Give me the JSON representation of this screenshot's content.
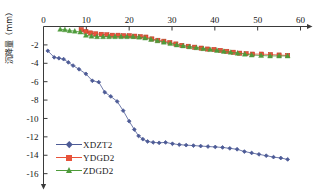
{
  "chart_data": {
    "type": "line",
    "title": "",
    "xlabel": "",
    "ylabel": "沉降量（mm）",
    "xlim": [
      0,
      60
    ],
    "ylim": [
      -16,
      0
    ],
    "xticks": [
      0,
      10,
      20,
      30,
      40,
      50,
      60
    ],
    "yticks": [
      -2,
      -4,
      -6,
      -8,
      -10,
      -12,
      -14,
      -16
    ],
    "xticklabels": [
      "0",
      "10",
      "20",
      "30",
      "40",
      "50",
      "60"
    ],
    "yticklabels": [
      "-2",
      "-4",
      "-6",
      "-8",
      "-10",
      "-12",
      "-14",
      "-16"
    ],
    "grid": false,
    "legend_position": "lower-left-inside",
    "axis_style": "top-x-axis-with-arrow, left-y-axis-with-arrow",
    "series": [
      {
        "name": "XDZT2",
        "color": "#4d5b96",
        "marker": "diamond",
        "x": [
          1.0,
          2.5,
          3.6,
          4.7,
          5.8,
          6.9,
          8.3,
          9.9,
          11.4,
          12.9,
          14.3,
          15.7,
          17.2,
          18.6,
          20.0,
          21.2,
          22.2,
          23.2,
          24.3,
          25.6,
          27.0,
          28.5,
          30.1,
          31.7,
          33.3,
          35.0,
          36.7,
          38.4,
          40.1,
          41.8,
          43.5,
          45.2,
          46.9,
          48.6,
          50.3,
          52.0,
          53.7,
          55.4,
          57.0
        ],
        "y": [
          -2.65,
          -3.35,
          -3.45,
          -3.55,
          -3.9,
          -4.25,
          -4.65,
          -5.15,
          -5.9,
          -6.05,
          -7.15,
          -7.6,
          -8.15,
          -9.15,
          -10.3,
          -11.2,
          -11.9,
          -12.25,
          -12.5,
          -12.6,
          -12.65,
          -12.6,
          -12.75,
          -12.85,
          -12.9,
          -12.95,
          -13.0,
          -13.05,
          -13.1,
          -13.15,
          -13.25,
          -13.35,
          -13.6,
          -13.75,
          -13.9,
          -14.05,
          -14.2,
          -14.3,
          -14.45
        ]
      },
      {
        "name": "YDGD2",
        "color": "#e8533a",
        "marker": "square",
        "x": [
          8.8,
          9.9,
          11.0,
          12.2,
          13.5,
          14.8,
          16.1,
          17.4,
          18.7,
          20.0,
          21.3,
          22.6,
          23.9,
          25.3,
          26.7,
          28.1,
          29.5,
          30.9,
          32.3,
          33.8,
          35.3,
          36.8,
          38.3,
          39.8,
          41.3,
          42.8,
          44.3,
          45.8,
          47.3,
          48.8,
          50.9,
          53.0,
          55.0,
          57.0
        ],
        "y": [
          -0.35,
          -0.55,
          -0.7,
          -0.8,
          -0.85,
          -0.9,
          -0.95,
          -0.95,
          -1.0,
          -1.0,
          -1.05,
          -1.1,
          -1.15,
          -1.35,
          -1.5,
          -1.6,
          -1.75,
          -1.9,
          -2.05,
          -2.15,
          -2.25,
          -2.35,
          -2.45,
          -2.5,
          -2.6,
          -2.7,
          -2.8,
          -2.9,
          -2.95,
          -3.0,
          -3.0,
          -3.05,
          -3.1,
          -3.15
        ]
      },
      {
        "name": "ZDGD2",
        "color": "#4e9b3b",
        "marker": "triangle",
        "x": [
          3.9,
          5.0,
          6.1,
          7.3,
          8.6,
          9.9,
          11.2,
          12.5,
          13.9,
          15.3,
          16.7,
          18.1,
          19.5,
          20.9,
          22.3,
          23.7,
          25.1,
          26.6,
          28.1,
          29.6,
          31.1,
          32.6,
          34.1,
          35.7,
          37.3,
          38.9,
          40.5,
          42.1,
          43.7,
          45.3,
          47.0,
          48.6,
          50.8,
          52.9,
          55.0,
          57.0
        ],
        "y": [
          -0.3,
          -0.35,
          -0.45,
          -0.5,
          -0.6,
          -0.95,
          -1.05,
          -1.1,
          -1.1,
          -1.1,
          -1.1,
          -1.1,
          -1.1,
          -1.1,
          -1.15,
          -1.25,
          -1.4,
          -1.55,
          -1.7,
          -1.85,
          -2.0,
          -2.1,
          -2.2,
          -2.3,
          -2.4,
          -2.5,
          -2.6,
          -2.7,
          -2.8,
          -2.9,
          -3.0,
          -3.1,
          -3.15,
          -3.2,
          -3.2,
          -3.2
        ]
      }
    ]
  },
  "legend": {
    "items": [
      {
        "label": "XDZT2",
        "color": "#4d5b96",
        "marker": "diamond"
      },
      {
        "label": "YDGD2",
        "color": "#e8533a",
        "marker": "square"
      },
      {
        "label": "ZDGD2",
        "color": "#4e9b3b",
        "marker": "triangle"
      }
    ]
  },
  "axis": {
    "y_title": "沉降量（mm）",
    "axis_color": "#3a3a3a"
  }
}
